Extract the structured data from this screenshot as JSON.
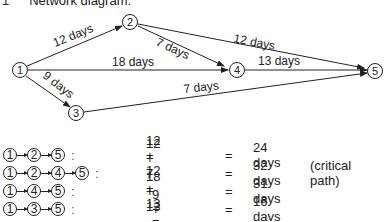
{
  "title": {
    "number": "1",
    "text": "Network diagram."
  },
  "diagram": {
    "nodes": [
      {
        "id": "1",
        "x": 20,
        "y": 70
      },
      {
        "id": "2",
        "x": 130,
        "y": 22
      },
      {
        "id": "3",
        "x": 76,
        "y": 113
      },
      {
        "id": "4",
        "x": 237,
        "y": 70
      },
      {
        "id": "5",
        "x": 375,
        "y": 71
      }
    ],
    "edges": [
      {
        "from": "1",
        "to": "2",
        "label": "12 days"
      },
      {
        "from": "2",
        "to": "4",
        "label": "7 days"
      },
      {
        "from": "2",
        "to": "5",
        "label": "12 days"
      },
      {
        "from": "1",
        "to": "4",
        "label": "18 days"
      },
      {
        "from": "4",
        "to": "5",
        "label": "13 days"
      },
      {
        "from": "1",
        "to": "3",
        "label": "9 days"
      },
      {
        "from": "3",
        "to": "5",
        "label": "7 days"
      }
    ]
  },
  "paths": [
    {
      "nodes": [
        "1",
        "2",
        "5"
      ],
      "expr": "12 + 12",
      "eq": "=",
      "result": "24 days",
      "note": ""
    },
    {
      "nodes": [
        "1",
        "2",
        "4",
        "5"
      ],
      "expr": "12 + 7 + 13",
      "eq": "=",
      "result": "32 days",
      "note": "(critical path)"
    },
    {
      "nodes": [
        "1",
        "4",
        "5"
      ],
      "expr": "18 + 13",
      "eq": "=",
      "result": "31 days",
      "note": ""
    },
    {
      "nodes": [
        "1",
        "3",
        "5"
      ],
      "expr": "9 + 7",
      "eq": "=",
      "result": "16 days",
      "note": ""
    }
  ]
}
